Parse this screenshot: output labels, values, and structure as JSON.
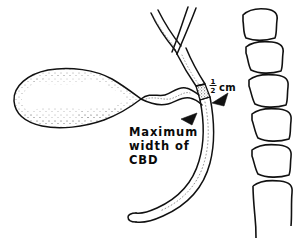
{
  "figure": {
    "type": "medical-line-illustration",
    "background_color": "#ffffff",
    "ink_color": "#111111",
    "width": 295,
    "height": 238
  },
  "labels": {
    "measurement": {
      "text": "½ cm",
      "numerator": "1",
      "denominator": "2",
      "unit": "cm",
      "value": 0.5
    },
    "annotation": {
      "line1": "Maximum",
      "line2": "width of",
      "line3": "CBD",
      "full_text": "Maximum width of CBD"
    }
  },
  "structures": [
    {
      "name": "gallbladder",
      "description": "pear-shaped fundus and body with stippled shading",
      "shaded": true
    },
    {
      "name": "cystic-duct",
      "description": "wavy duct from gallbladder neck to confluence"
    },
    {
      "name": "left-hepatic-duct",
      "description": "upper-left limb of the hepatic duct bifurcation"
    },
    {
      "name": "right-hepatic-duct",
      "description": "upper-right limb of the hepatic duct bifurcation"
    },
    {
      "name": "common-hepatic-duct",
      "description": "trunk descending from the hepatic confluence"
    },
    {
      "name": "common-bile-duct",
      "description": "curving duct descending and sweeping left to the ampulla"
    },
    {
      "name": "measurement-band",
      "description": "stippled cross band marking the site of maximum CBD width"
    },
    {
      "name": "arrowhead-upper",
      "description": "solid triangular pointer from the right at the measurement site"
    },
    {
      "name": "arrowhead-lower",
      "description": "solid triangular pointer from the left at the measurement site"
    }
  ],
  "vertebrae": {
    "count": 6,
    "description": "lumbar vertebral bodies drawn as rounded wavy-edged blocks descending to the right",
    "last_partial": true
  }
}
